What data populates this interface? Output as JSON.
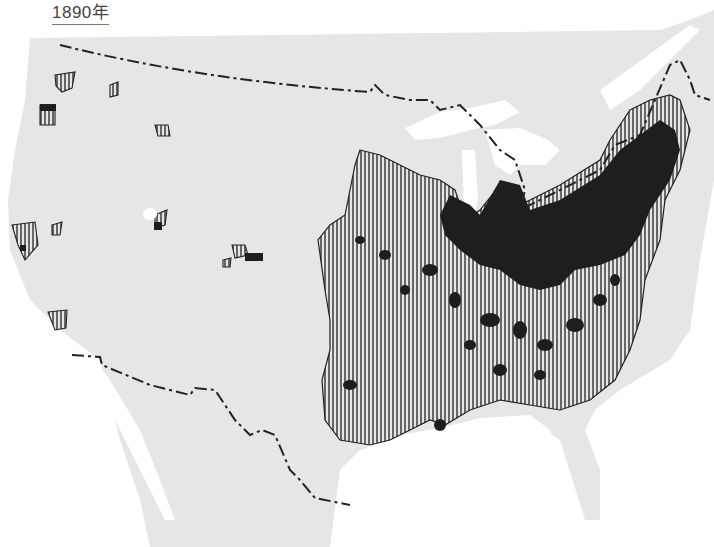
{
  "title": "1890年",
  "map": {
    "subject": "United States settlement / population density, 1890",
    "colors": {
      "background": "#ffffff",
      "land": "#e6e6e6",
      "water": "#ffffff",
      "dense": "#1e1e1e",
      "hatched_line": "#222222",
      "border_line": "#222222"
    },
    "legend_categories": [
      "sparse (unshaded)",
      "settled (vertical hatching)",
      "dense (solid black)"
    ],
    "borders": [
      "canada-us-border",
      "mexico-us-border"
    ]
  }
}
